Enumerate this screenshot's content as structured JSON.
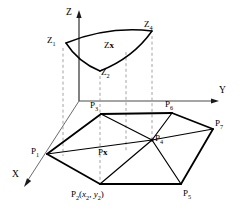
{
  "figure": {
    "background_color": "#ffffff",
    "stroke_color": "#000000",
    "dashed_color": "#9a9a9a"
  },
  "axes": {
    "z_label": "Z",
    "y_label": "Y",
    "x_label": "X"
  },
  "upper_surface": {
    "labels": [
      {
        "id": "z1",
        "text": "Z",
        "sub": "1"
      },
      {
        "id": "z2",
        "text": "Z",
        "sub": "2"
      },
      {
        "id": "z4",
        "text": "Z",
        "sub": "4"
      },
      {
        "id": "zx",
        "text": "Z",
        "bold_suffix": "x"
      }
    ]
  },
  "lower_polygon": {
    "labels": [
      {
        "id": "p1",
        "text": "P",
        "sub": "1"
      },
      {
        "id": "p2",
        "text": "P",
        "sub": "2",
        "coords": "(x2, y2)"
      },
      {
        "id": "p3",
        "text": "P",
        "sub": "3"
      },
      {
        "id": "p4",
        "text": "P",
        "sub": "4"
      },
      {
        "id": "p5",
        "text": "P",
        "sub": "5"
      },
      {
        "id": "p6",
        "text": "P",
        "sub": "6"
      },
      {
        "id": "p7",
        "text": "P",
        "sub": "7"
      },
      {
        "id": "px",
        "text": "P",
        "bold_suffix": "x"
      }
    ]
  },
  "label_text": {
    "z_axis": "Z",
    "y_axis": "Y",
    "x_axis": "X",
    "z1_base": "Z",
    "z1_sub": "1",
    "z2_base": "Z",
    "z2_sub": "2",
    "z4_base": "Z",
    "z4_sub": "4",
    "zx_base": "Z",
    "zx_bold": "x",
    "p1_base": "P",
    "p1_sub": "1",
    "p2_base": "P",
    "p2_sub": "2",
    "p2_open": "(",
    "p2_x": "x",
    "p2_xsub": "2",
    "p2_comma": ", ",
    "p2_y": "y",
    "p2_ysub": "2",
    "p2_close": ")",
    "p3_base": "P",
    "p3_sub": "3",
    "p4_base": "P",
    "p4_sub": "4",
    "p5_base": "P",
    "p5_sub": "5",
    "p6_base": "P",
    "p6_sub": "6",
    "p7_base": "P",
    "p7_sub": "7",
    "px_base": "P",
    "px_bold": "x"
  },
  "geometry": {
    "note": "2D projected coordinates in screenshot pixel space",
    "origin": {
      "x": 79,
      "y": 101
    },
    "z_axis_top": {
      "x": 79,
      "y": 12
    },
    "y_axis_end": {
      "x": 218,
      "y": 101
    },
    "x_axis_end": {
      "x": 22,
      "y": 186
    },
    "surface_points": {
      "Z1": {
        "x": 66,
        "y": 42
      },
      "Z2": {
        "x": 100,
        "y": 70
      },
      "Z4": {
        "x": 152,
        "y": 30
      }
    },
    "polygon_points": {
      "P1": {
        "x": 47,
        "y": 154
      },
      "P2": {
        "x": 100,
        "y": 184
      },
      "P3": {
        "x": 101,
        "y": 113
      },
      "P4": {
        "x": 152,
        "y": 140
      },
      "P5": {
        "x": 181,
        "y": 184
      },
      "P6": {
        "x": 172,
        "y": 112
      },
      "P7": {
        "x": 213,
        "y": 128
      }
    }
  }
}
